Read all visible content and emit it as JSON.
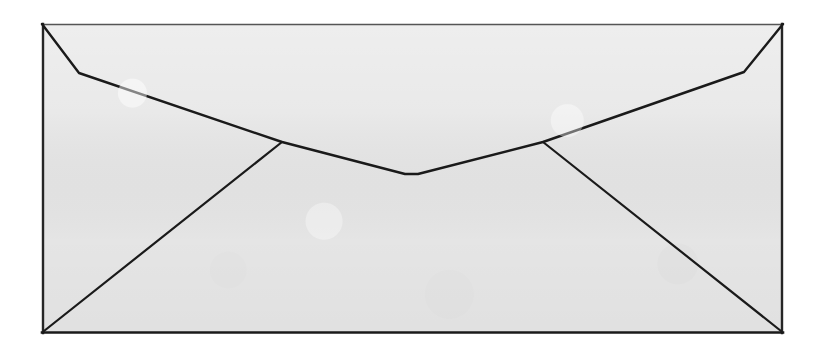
{
  "image": {
    "title": "Envelope",
    "subject": "envelope-back-with-flap",
    "type": "line-drawing",
    "width": 828,
    "height": 351,
    "background_color": "#ffffff",
    "caption": ""
  },
  "colors": {
    "page_background": "#ffffff",
    "envelope_fill": "#e7e7e7",
    "line_color": "#1a1a1a",
    "top_edge_color": "#555555",
    "side_edge_color": "#262626"
  },
  "geometry": {
    "units": "pixels",
    "body": {
      "name": "envelope-outline",
      "points": [
        [
          42,
          24
        ],
        [
          783,
          24
        ],
        [
          783,
          333
        ],
        [
          42,
          333
        ]
      ],
      "stroke_width": 2.2
    },
    "flap": {
      "name": "envelope-flap",
      "description": "Upper flap folded down forming a wide V across the envelope back",
      "points": [
        [
          42,
          24
        ],
        [
          79,
          73
        ],
        [
          282,
          142
        ],
        [
          405,
          174
        ],
        [
          418,
          174
        ],
        [
          543,
          142
        ],
        [
          744,
          72
        ],
        [
          783,
          24
        ]
      ],
      "stroke_width": 2.4
    },
    "left_seam": {
      "name": "left-side-seam",
      "points": [
        [
          282,
          142
        ],
        [
          44,
          331
        ]
      ],
      "stroke_width": 2.2
    },
    "right_seam": {
      "name": "right-side-seam",
      "points": [
        [
          543,
          142
        ],
        [
          781,
          331
        ]
      ],
      "stroke_width": 2.2
    },
    "vertices": {
      "top_left_corner": [
        42,
        24
      ],
      "top_right_corner": [
        783,
        24
      ],
      "bottom_left_corner": [
        42,
        333
      ],
      "bottom_right_corner": [
        783,
        333
      ],
      "left_flap_shoulder": [
        79,
        73
      ],
      "right_flap_shoulder": [
        744,
        72
      ],
      "left_seam_junction": [
        282,
        142
      ],
      "right_seam_junction": [
        543,
        142
      ],
      "flap_apex": [
        412,
        175
      ]
    }
  },
  "labels": {
    "envelope": "envelope",
    "flap": "flap",
    "left_seam": "left seam",
    "right_seam": "right seam"
  }
}
